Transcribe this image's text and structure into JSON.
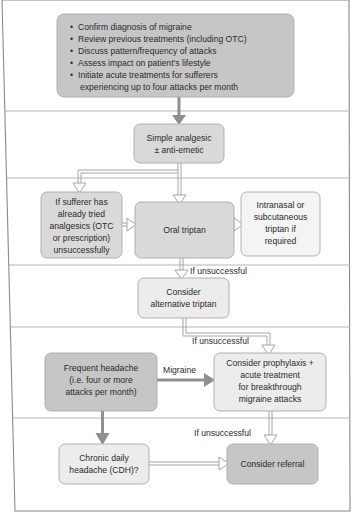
{
  "diagram": {
    "top_box": {
      "bullets": [
        "Confirm diagnosis of migraine",
        "Review previous treatments (including OTC)",
        "Discuss pattern/frequency of attacks",
        "Assess impact on patient’s lifestyle",
        "Initiate acute treatments for sufferers"
      ],
      "continuation": "experiencing up to four attacks per month"
    },
    "simple_analgesic": [
      "Simple analgesic",
      "± anti-emetic"
    ],
    "tried_analgesics": [
      "If sufferer has",
      "already tried",
      "analgesics (OTC",
      "or prescription)",
      "unsuccessfully"
    ],
    "oral_triptan": [
      "Oral triptan"
    ],
    "intranasal": [
      "Intranasal or",
      "subcutaneous",
      "triptan if",
      "required"
    ],
    "if_unsuccessful_1": "If unsuccessful",
    "alternative_triptan": [
      "Consider",
      "alternative triptan"
    ],
    "if_unsuccessful_2": "If unsuccessful",
    "frequent_headache": [
      "Frequent headache",
      "(i.e. four or more",
      "attacks per month)"
    ],
    "migraine_label": "Migraine",
    "prophylaxis": [
      "Consider prophylaxis +",
      "acute treatment",
      "for breakthrough",
      "migraine attacks"
    ],
    "if_unsuccessful_3": "If unsuccessful",
    "cdh": [
      "Chronic daily",
      "headache (CDH)?"
    ],
    "referral": [
      "Consider referral"
    ],
    "colors": {
      "dark_box": "#c6c6c6",
      "mid_box": "#d9d9d9",
      "light_box": "#ececec",
      "arrow": "#8f8f8f",
      "border": "#a9a9a9"
    }
  }
}
